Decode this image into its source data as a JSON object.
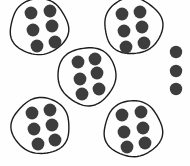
{
  "figure": {
    "title": "Grouped counters diagram",
    "background_color": "#fefefe",
    "dot_color": "#3d3d3d",
    "ring_stroke_color": "#1c1c1c",
    "ring_stroke_width": 1.4,
    "width": 190,
    "height": 166
  },
  "chart_data": {
    "type": "scatter",
    "title": "Grouped counters diagram",
    "xlabel": "",
    "ylabel": "",
    "xlim": [
      0,
      190
    ],
    "ylim": [
      0,
      166
    ],
    "grid": false,
    "legend": null,
    "total_dots": 33,
    "group_count": 5,
    "dots_per_group": 6,
    "leftover_dots": 3,
    "groups": [
      {
        "name": "group-top-left",
        "label": "Top left group",
        "dot_count": 6,
        "ring": {
          "cx": 39,
          "cy": 27,
          "rx": 29,
          "ry": 28,
          "rotation": -8
        },
        "dots": [
          {
            "cx": 31,
            "cy": 13,
            "r": 6.4
          },
          {
            "cx": 50,
            "cy": 11,
            "r": 6.4
          },
          {
            "cx": 33,
            "cy": 30,
            "r": 6.4
          },
          {
            "cx": 52,
            "cy": 26,
            "r": 6.4
          },
          {
            "cx": 37,
            "cy": 46,
            "r": 6.4
          },
          {
            "cx": 55,
            "cy": 42,
            "r": 6.4
          }
        ]
      },
      {
        "name": "group-top-right",
        "label": "Top right group",
        "dot_count": 6,
        "ring": {
          "cx": 133,
          "cy": 26,
          "rx": 29,
          "ry": 28,
          "rotation": 6
        },
        "dots": [
          {
            "cx": 122,
            "cy": 14,
            "r": 6.4
          },
          {
            "cx": 140,
            "cy": 12,
            "r": 6.4
          },
          {
            "cx": 124,
            "cy": 31,
            "r": 6.4
          },
          {
            "cx": 142,
            "cy": 27,
            "r": 6.4
          },
          {
            "cx": 126,
            "cy": 47,
            "r": 6.4
          },
          {
            "cx": 144,
            "cy": 43,
            "r": 6.4
          }
        ]
      },
      {
        "name": "group-middle",
        "label": "Middle group",
        "dot_count": 6,
        "ring": {
          "cx": 87,
          "cy": 76,
          "rx": 29,
          "ry": 29,
          "rotation": -3
        },
        "dots": [
          {
            "cx": 78,
            "cy": 62,
            "r": 6.4
          },
          {
            "cx": 95,
            "cy": 59,
            "r": 6.4
          },
          {
            "cx": 80,
            "cy": 79,
            "r": 6.4
          },
          {
            "cx": 97,
            "cy": 73,
            "r": 6.4
          },
          {
            "cx": 82,
            "cy": 94,
            "r": 6.4
          },
          {
            "cx": 99,
            "cy": 89,
            "r": 6.4
          }
        ]
      },
      {
        "name": "group-bottom-left",
        "label": "Bottom left group",
        "dot_count": 6,
        "ring": {
          "cx": 41,
          "cy": 126,
          "rx": 29,
          "ry": 28,
          "rotation": -5
        },
        "dots": [
          {
            "cx": 32,
            "cy": 113,
            "r": 6.4
          },
          {
            "cx": 50,
            "cy": 110,
            "r": 6.4
          },
          {
            "cx": 34,
            "cy": 129,
            "r": 6.4
          },
          {
            "cx": 52,
            "cy": 125,
            "r": 6.4
          },
          {
            "cx": 38,
            "cy": 144,
            "r": 6.4
          },
          {
            "cx": 55,
            "cy": 140,
            "r": 6.4
          }
        ]
      },
      {
        "name": "group-bottom-right",
        "label": "Bottom right group",
        "dot_count": 6,
        "ring": {
          "cx": 133,
          "cy": 129,
          "rx": 29,
          "ry": 28,
          "rotation": 5
        },
        "dots": [
          {
            "cx": 122,
            "cy": 115,
            "r": 6.4
          },
          {
            "cx": 141,
            "cy": 112,
            "r": 6.4
          },
          {
            "cx": 124,
            "cy": 132,
            "r": 6.4
          },
          {
            "cx": 143,
            "cy": 128,
            "r": 6.4
          },
          {
            "cx": 127,
            "cy": 147,
            "r": 6.4
          },
          {
            "cx": 145,
            "cy": 143,
            "r": 6.4
          }
        ]
      }
    ],
    "loose_dots": {
      "name": "ungrouped-dots",
      "label": "Ungrouped dots",
      "dot_count": 3,
      "dots": [
        {
          "cx": 176,
          "cy": 52,
          "r": 6.2
        },
        {
          "cx": 176,
          "cy": 71,
          "r": 6.2
        },
        {
          "cx": 176,
          "cy": 89,
          "r": 6.2
        }
      ]
    }
  }
}
